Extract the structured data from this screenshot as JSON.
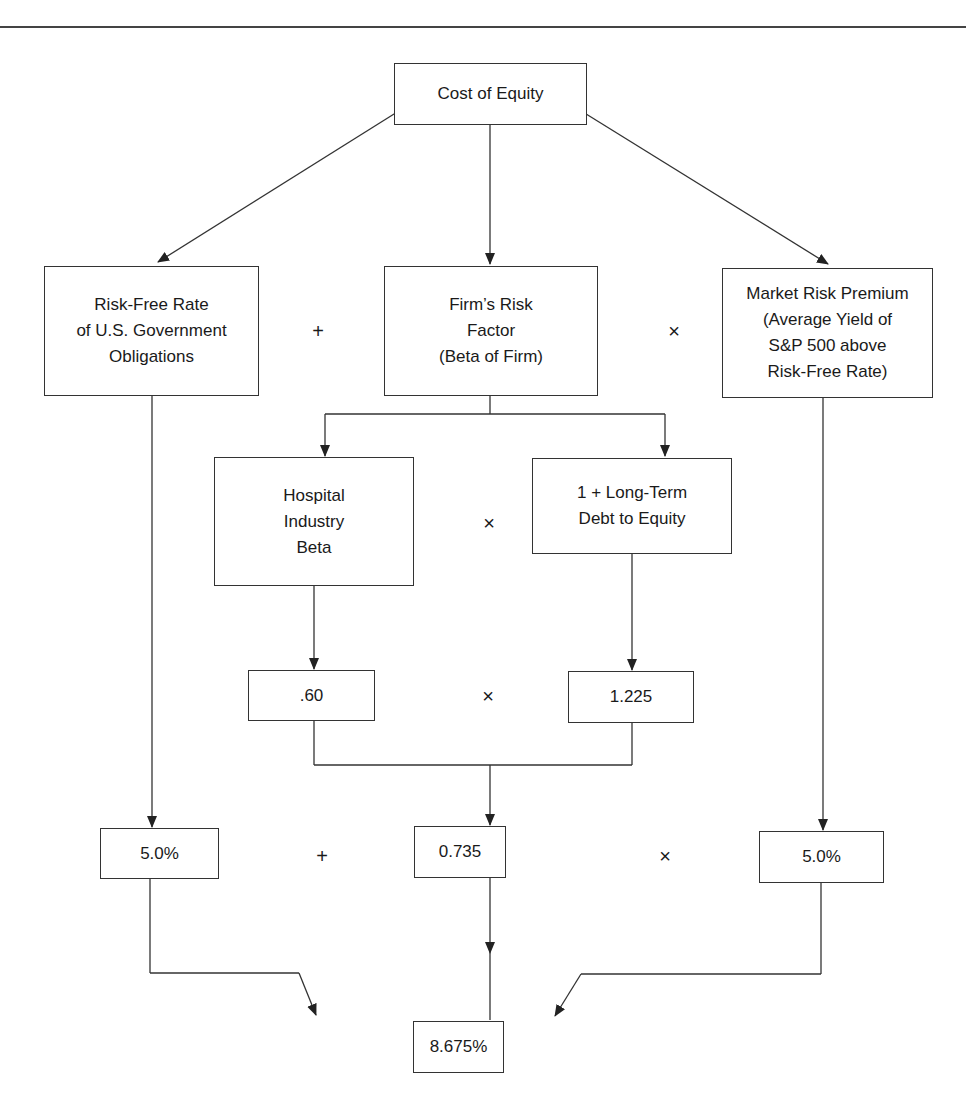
{
  "diagram": {
    "title_box": "Cost of Equity",
    "level1": {
      "risk_free": "Risk-Free Rate\nof U.S. Government\nObligations",
      "firm_risk": "Firm’s Risk\nFactor\n(Beta of Firm)",
      "market_premium": "Market Risk Premium\n(Average Yield of\nS&P 500 above\nRisk-Free Rate)",
      "op1": "+",
      "op2": "×"
    },
    "level2": {
      "industry_beta": "Hospital\nIndustry\nBeta",
      "debt_equity": "1 + Long-Term\nDebt to Equity",
      "op": "×"
    },
    "level3": {
      "industry_beta_value": ".60",
      "debt_equity_value": "1.225",
      "op": "×"
    },
    "level4": {
      "risk_free_value": "5.0%",
      "beta_value": "0.735",
      "market_premium_value": "5.0%",
      "op1": "+",
      "op2": "×"
    },
    "result": "8.675%"
  }
}
